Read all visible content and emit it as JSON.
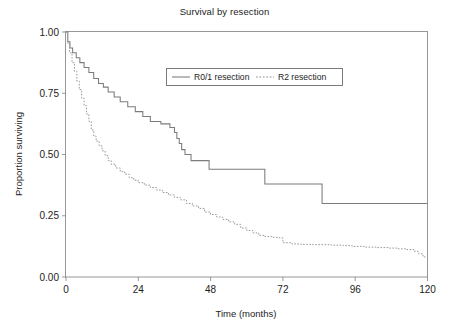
{
  "chart_data": {
    "type": "line",
    "title": "Survival by resection",
    "xlabel": "Time (months)",
    "ylabel": "Proportion surviving",
    "xlim": [
      0,
      120
    ],
    "ylim": [
      0,
      1
    ],
    "xticks": [
      0,
      24,
      48,
      72,
      96,
      120
    ],
    "xtick_labels": [
      "0",
      "24",
      "48",
      "72",
      "96",
      "120"
    ],
    "yticks": [
      0.0,
      0.25,
      0.5,
      0.75,
      1.0
    ],
    "ytick_labels": [
      "0.00",
      "0.25",
      "0.50",
      "0.75",
      "1.00"
    ],
    "grid": false,
    "legend_position": "upper center",
    "curve_style": "kaplan-meier step",
    "series": [
      {
        "name": "R0/1 resection",
        "style": "solid",
        "color": "#7b7b7b",
        "points": [
          [
            0,
            1.0
          ],
          [
            0.6,
            0.96
          ],
          [
            1.3,
            0.935
          ],
          [
            2.2,
            0.915
          ],
          [
            3.4,
            0.895
          ],
          [
            4.6,
            0.875
          ],
          [
            6.0,
            0.855
          ],
          [
            7.6,
            0.835
          ],
          [
            9.2,
            0.81
          ],
          [
            10.8,
            0.79
          ],
          [
            12.4,
            0.775
          ],
          [
            14.0,
            0.755
          ],
          [
            16.0,
            0.735
          ],
          [
            18.0,
            0.715
          ],
          [
            20.5,
            0.695
          ],
          [
            23.0,
            0.675
          ],
          [
            25.5,
            0.655
          ],
          [
            28.0,
            0.635
          ],
          [
            31.5,
            0.625
          ],
          [
            34.5,
            0.61
          ],
          [
            36.0,
            0.59
          ],
          [
            36.8,
            0.565
          ],
          [
            37.6,
            0.545
          ],
          [
            38.4,
            0.52
          ],
          [
            39.5,
            0.5
          ],
          [
            41.5,
            0.475
          ],
          [
            47.5,
            0.44
          ],
          [
            66.0,
            0.38
          ],
          [
            85.0,
            0.3
          ],
          [
            120.0,
            0.3
          ]
        ]
      },
      {
        "name": "R2 resection",
        "style": "dotted",
        "color": "#9a9a9a",
        "points": [
          [
            0,
            1.0
          ],
          [
            0.5,
            0.955
          ],
          [
            1.2,
            0.915
          ],
          [
            2.0,
            0.875
          ],
          [
            2.8,
            0.84
          ],
          [
            3.6,
            0.8
          ],
          [
            4.4,
            0.765
          ],
          [
            5.2,
            0.73
          ],
          [
            6.0,
            0.7
          ],
          [
            6.8,
            0.665
          ],
          [
            7.6,
            0.635
          ],
          [
            8.4,
            0.6
          ],
          [
            9.2,
            0.575
          ],
          [
            10.0,
            0.555
          ],
          [
            11.0,
            0.535
          ],
          [
            12.0,
            0.515
          ],
          [
            13.0,
            0.495
          ],
          [
            14.0,
            0.475
          ],
          [
            15.0,
            0.46
          ],
          [
            16.5,
            0.445
          ],
          [
            18.0,
            0.43
          ],
          [
            19.5,
            0.42
          ],
          [
            21.0,
            0.405
          ],
          [
            22.5,
            0.395
          ],
          [
            24.0,
            0.385
          ],
          [
            26.0,
            0.375
          ],
          [
            28.0,
            0.365
          ],
          [
            30.0,
            0.355
          ],
          [
            32.0,
            0.345
          ],
          [
            34.0,
            0.335
          ],
          [
            36.0,
            0.325
          ],
          [
            38.0,
            0.315
          ],
          [
            40.0,
            0.3
          ],
          [
            42.0,
            0.29
          ],
          [
            44.0,
            0.28
          ],
          [
            46.0,
            0.265
          ],
          [
            48.0,
            0.255
          ],
          [
            50.0,
            0.245
          ],
          [
            52.0,
            0.235
          ],
          [
            54.0,
            0.225
          ],
          [
            56.0,
            0.215
          ],
          [
            58.0,
            0.2
          ],
          [
            60.0,
            0.19
          ],
          [
            62.0,
            0.18
          ],
          [
            64.0,
            0.17
          ],
          [
            66.0,
            0.165
          ],
          [
            68.5,
            0.162
          ],
          [
            70.5,
            0.16
          ],
          [
            72.0,
            0.14
          ],
          [
            75.0,
            0.135
          ],
          [
            78.0,
            0.133
          ],
          [
            82.0,
            0.132
          ],
          [
            88.0,
            0.13
          ],
          [
            92.0,
            0.128
          ],
          [
            95.0,
            0.125
          ],
          [
            99.0,
            0.122
          ],
          [
            103.0,
            0.12
          ],
          [
            107.0,
            0.118
          ],
          [
            110.0,
            0.115
          ],
          [
            113.0,
            0.112
          ],
          [
            115.5,
            0.105
          ],
          [
            117.0,
            0.095
          ],
          [
            118.5,
            0.082
          ],
          [
            120.0,
            0.07
          ]
        ]
      }
    ]
  },
  "legend": {
    "items": [
      {
        "label": "R0/1 resection",
        "style": "solid"
      },
      {
        "label": "R2 resection",
        "style": "dotted"
      }
    ]
  }
}
